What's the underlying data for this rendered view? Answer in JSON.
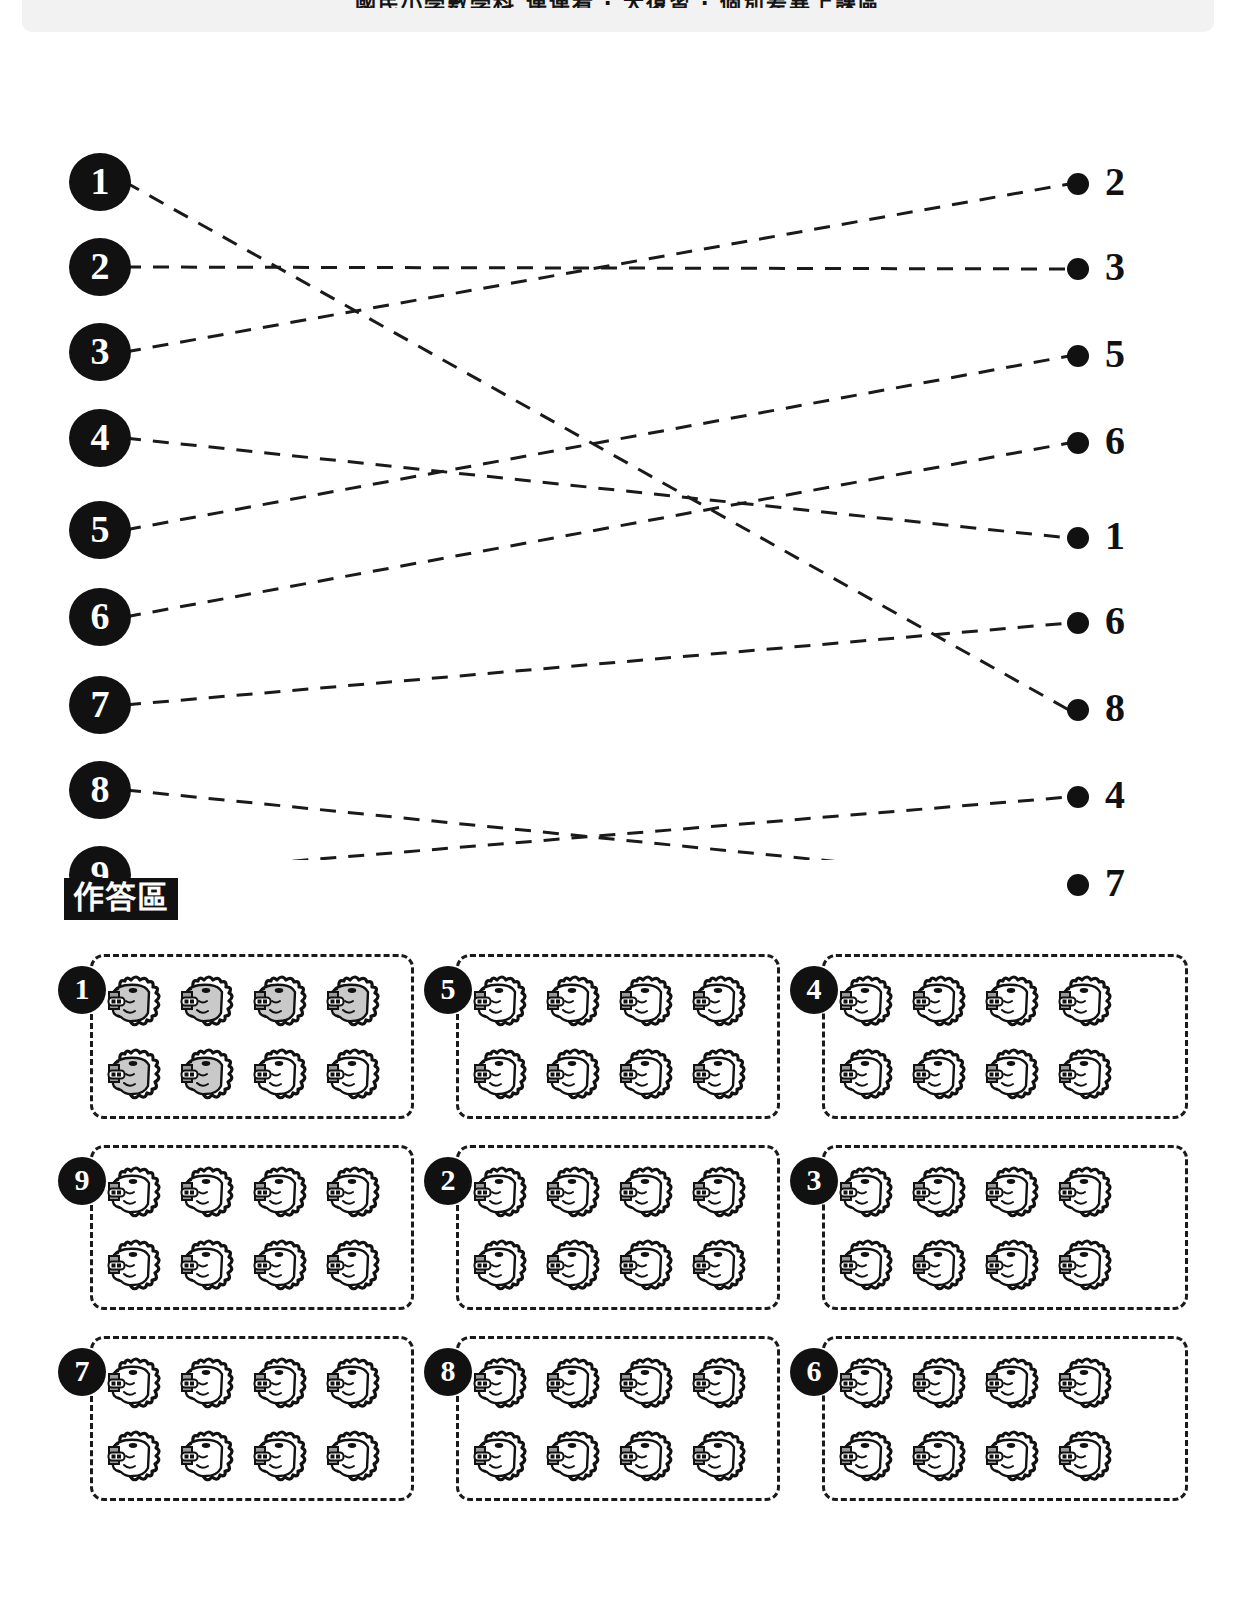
{
  "header": {
    "text": "國民小學數學科 連連看 ‧ 大復習 ‧ 個別差異上課區"
  },
  "matching": {
    "title": "matching-diagram",
    "left_nodes": [
      {
        "label": "1",
        "y": 122
      },
      {
        "label": "2",
        "y": 207
      },
      {
        "label": "3",
        "y": 292
      },
      {
        "label": "4",
        "y": 378
      },
      {
        "label": "5",
        "y": 470
      },
      {
        "label": "6",
        "y": 557
      },
      {
        "label": "7",
        "y": 645
      },
      {
        "label": "8",
        "y": 730
      },
      {
        "label": "9",
        "y": 815
      }
    ],
    "right_nodes": [
      {
        "label": "2",
        "y": 124
      },
      {
        "label": "3",
        "y": 209
      },
      {
        "label": "5",
        "y": 296
      },
      {
        "label": "6",
        "y": 383
      },
      {
        "label": "1",
        "y": 478
      },
      {
        "label": "6",
        "y": 563
      },
      {
        "label": "8",
        "y": 650
      },
      {
        "label": "4",
        "y": 737
      },
      {
        "label": "7",
        "y": 825
      }
    ],
    "connections": [
      {
        "from": 0,
        "to": 6
      },
      {
        "from": 1,
        "to": 1
      },
      {
        "from": 2,
        "to": 0
      },
      {
        "from": 3,
        "to": 4
      },
      {
        "from": 4,
        "to": 2
      },
      {
        "from": 5,
        "to": 3
      },
      {
        "from": 6,
        "to": 5
      },
      {
        "from": 7,
        "to": 8
      },
      {
        "from": 8,
        "to": 7
      }
    ],
    "line_style": "dashed",
    "line_color": "#1a1a1a"
  },
  "answer_section": {
    "heading": "作答區",
    "icon_name": "lion-head-icon",
    "shaded_color": "#c9c9c9",
    "rows": [
      {
        "groups": [
          {
            "label": "1",
            "left": 0,
            "width": 356,
            "icons": [
              "shaded",
              "shaded",
              "shaded",
              "shaded",
              "shaded",
              "shaded",
              "plain",
              "plain"
            ]
          },
          {
            "label": "5",
            "left": 366,
            "width": 356,
            "icons": [
              "plain",
              "plain",
              "plain",
              "plain",
              "plain",
              "plain",
              "plain",
              "plain"
            ]
          },
          {
            "label": "4",
            "left": 732,
            "width": 398,
            "icons": [
              "plain",
              "plain",
              "plain",
              "plain",
              "plain",
              "plain",
              "plain",
              "plain"
            ]
          }
        ]
      },
      {
        "groups": [
          {
            "label": "9",
            "left": 0,
            "width": 356,
            "icons": [
              "plain",
              "plain",
              "plain",
              "plain",
              "plain",
              "plain",
              "plain",
              "plain"
            ]
          },
          {
            "label": "2",
            "left": 366,
            "width": 356,
            "icons": [
              "plain",
              "plain",
              "plain",
              "plain",
              "plain",
              "plain",
              "plain",
              "plain"
            ]
          },
          {
            "label": "3",
            "left": 732,
            "width": 398,
            "icons": [
              "plain",
              "plain",
              "plain",
              "plain",
              "plain",
              "plain",
              "plain",
              "plain"
            ]
          }
        ]
      },
      {
        "groups": [
          {
            "label": "7",
            "left": 0,
            "width": 356,
            "icons": [
              "plain",
              "plain",
              "plain",
              "plain",
              "plain",
              "plain",
              "plain",
              "plain"
            ]
          },
          {
            "label": "8",
            "left": 366,
            "width": 356,
            "icons": [
              "plain",
              "plain",
              "plain",
              "plain",
              "plain",
              "plain",
              "plain",
              "plain"
            ]
          },
          {
            "label": "6",
            "left": 732,
            "width": 398,
            "icons": [
              "plain",
              "plain",
              "plain",
              "plain",
              "plain",
              "plain",
              "plain",
              "plain"
            ]
          }
        ]
      }
    ]
  }
}
